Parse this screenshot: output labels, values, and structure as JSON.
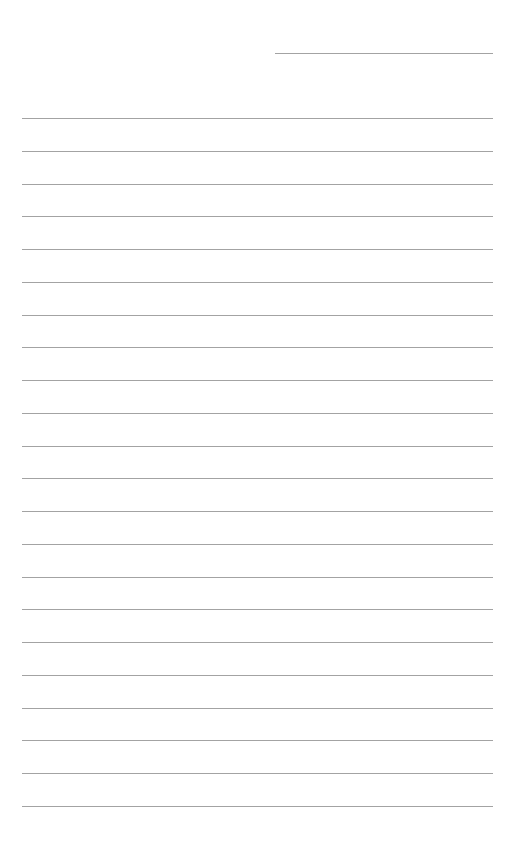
{
  "page": {
    "type": "lined-paper",
    "background": "#ffffff",
    "line_color": "#a3a3a3"
  },
  "header_line": {
    "x1": 275,
    "x2": 493,
    "y": 53
  },
  "ruled_lines": {
    "count": 22,
    "x1": 22,
    "x2": 493,
    "first_y": 118,
    "spacing": 32.76
  }
}
